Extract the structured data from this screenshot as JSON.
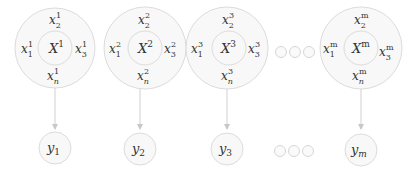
{
  "diagram": {
    "colors": {
      "stroke": "#d9d9d9",
      "fill": "#f7f7f7",
      "text": "#333333",
      "arrow": "#c8c8c8"
    },
    "groups": [
      {
        "id": "1",
        "core": "X",
        "sup": "1",
        "x1": "x",
        "x1sub": "1",
        "x2sub": "2",
        "x3sub": "3",
        "xnsub": "n",
        "y": "y",
        "ysub": "1"
      },
      {
        "id": "2",
        "core": "X",
        "sup": "2",
        "x1": "x",
        "x1sub": "1",
        "x2sub": "2",
        "x3sub": "3",
        "xnsub": "n",
        "y": "y",
        "ysub": "2"
      },
      {
        "id": "3",
        "core": "X",
        "sup": "3",
        "x1": "x",
        "x1sub": "1",
        "x2sub": "2",
        "x3sub": "3",
        "xnsub": "n",
        "y": "y",
        "ysub": "3"
      },
      {
        "id": "m",
        "core": "X",
        "sup": "m",
        "x1": "x",
        "x1sub": "1",
        "x2sub": "2",
        "x3sub": "3",
        "xnsub": "n",
        "y": "y",
        "ysub": "m"
      }
    ],
    "ellipsis_top": "○○○",
    "ellipsis_bottom": "○○○"
  }
}
